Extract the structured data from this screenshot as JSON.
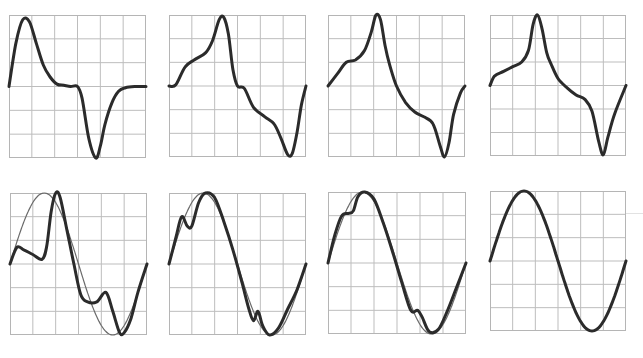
{
  "figure": {
    "layout": {
      "rows": 2,
      "cols": 4,
      "grid_divisions": 6
    },
    "colors": {
      "trace": "#2b2b2b",
      "reference": "#6a6a6a",
      "grid": "#bdbdbd"
    }
  },
  "chart_data": [
    {
      "type": "line",
      "panel": "top-1",
      "title": "",
      "xlabel": "",
      "ylabel": "",
      "grid": true,
      "xlim": [
        0,
        6
      ],
      "ylim": [
        -3,
        3
      ],
      "series": [
        {
          "name": "waveform",
          "x": [
            0,
            0.3,
            0.6,
            0.9,
            1.2,
            1.5,
            1.8,
            2.1,
            2.4,
            2.7,
            3.0,
            3.2,
            3.5,
            3.8,
            4.0,
            4.2,
            4.5,
            4.8,
            5.1,
            5.5,
            6.0
          ],
          "y": [
            0,
            1.8,
            2.8,
            2.7,
            1.8,
            0.9,
            0.4,
            0.1,
            0.05,
            0,
            0,
            -0.5,
            -2.2,
            -3.0,
            -2.5,
            -1.6,
            -0.7,
            -0.2,
            -0.05,
            0,
            0
          ]
        }
      ]
    },
    {
      "type": "line",
      "panel": "top-2",
      "title": "",
      "xlabel": "",
      "ylabel": "",
      "grid": true,
      "xlim": [
        0,
        6
      ],
      "ylim": [
        -3,
        3
      ],
      "series": [
        {
          "name": "waveform",
          "x": [
            0,
            0.3,
            0.7,
            1.1,
            1.6,
            1.9,
            2.2,
            2.4,
            2.6,
            2.8,
            3.0,
            3.3,
            3.7,
            4.2,
            4.6,
            4.9,
            5.2,
            5.4,
            5.6,
            5.8,
            6.0
          ],
          "y": [
            0,
            0.05,
            0.8,
            1.1,
            1.4,
            1.9,
            2.8,
            2.9,
            2.2,
            0.7,
            0,
            -0.1,
            -0.9,
            -1.3,
            -1.6,
            -2.2,
            -2.9,
            -2.85,
            -2.0,
            -0.8,
            0
          ]
        }
      ]
    },
    {
      "type": "line",
      "panel": "top-3",
      "title": "",
      "xlabel": "",
      "ylabel": "",
      "grid": true,
      "xlim": [
        0,
        6
      ],
      "ylim": [
        -3,
        3
      ],
      "series": [
        {
          "name": "waveform",
          "x": [
            0,
            0.4,
            0.8,
            1.2,
            1.6,
            1.9,
            2.1,
            2.3,
            2.5,
            2.7,
            3.0,
            3.4,
            3.8,
            4.2,
            4.6,
            4.9,
            5.1,
            5.3,
            5.5,
            5.8,
            6.0
          ],
          "y": [
            0,
            0.5,
            1.0,
            1.1,
            1.5,
            2.3,
            3.0,
            2.8,
            1.7,
            0.9,
            0,
            -0.7,
            -1.1,
            -1.3,
            -1.6,
            -2.5,
            -3.0,
            -2.4,
            -1.2,
            -0.3,
            0
          ]
        }
      ]
    },
    {
      "type": "line",
      "panel": "top-4",
      "title": "",
      "xlabel": "",
      "ylabel": "",
      "grid": true,
      "xlim": [
        0,
        6
      ],
      "ylim": [
        -3,
        3
      ],
      "series": [
        {
          "name": "waveform",
          "x": [
            0,
            0.2,
            0.6,
            1.0,
            1.4,
            1.7,
            1.9,
            2.1,
            2.3,
            2.5,
            2.7,
            3.0,
            3.4,
            3.8,
            4.2,
            4.5,
            4.8,
            5.0,
            5.2,
            5.5,
            6.0
          ],
          "y": [
            0,
            0.4,
            0.6,
            0.8,
            1.0,
            1.5,
            2.6,
            3.0,
            2.4,
            1.4,
            0.9,
            0.3,
            -0.1,
            -0.4,
            -0.6,
            -1.1,
            -2.4,
            -2.95,
            -2.2,
            -1.2,
            0
          ]
        }
      ]
    },
    {
      "type": "line",
      "panel": "bottom-1",
      "title": "",
      "xlabel": "",
      "ylabel": "",
      "grid": true,
      "xlim": [
        0,
        6
      ],
      "ylim": [
        -3,
        3
      ],
      "series": [
        {
          "name": "distorted",
          "x": [
            0,
            0.3,
            0.6,
            1.0,
            1.4,
            1.6,
            1.8,
            2.0,
            2.2,
            2.5,
            2.8,
            3.1,
            3.4,
            3.8,
            4.2,
            4.5,
            4.8,
            5.0,
            5.3,
            5.6,
            6.0
          ],
          "y": [
            0,
            0.7,
            0.6,
            0.4,
            0.2,
            0.7,
            2.2,
            3.0,
            2.8,
            1.4,
            0,
            -1.3,
            -1.6,
            -1.6,
            -1.2,
            -2.0,
            -2.9,
            -2.9,
            -2.3,
            -1.2,
            0
          ]
        },
        {
          "name": "reference-sine",
          "function": "3*sin(pi*x/3)",
          "x": [
            0,
            1.5,
            3,
            4.5,
            6
          ],
          "y": [
            0,
            3,
            0,
            -3,
            0
          ]
        }
      ]
    },
    {
      "type": "line",
      "panel": "bottom-2",
      "title": "",
      "xlabel": "",
      "ylabel": "",
      "grid": true,
      "xlim": [
        0,
        6
      ],
      "ylim": [
        -3,
        3
      ],
      "series": [
        {
          "name": "distorted",
          "x": [
            0,
            0.3,
            0.55,
            0.8,
            1.0,
            1.3,
            1.6,
            2.0,
            2.4,
            2.8,
            3.2,
            3.5,
            3.7,
            3.9,
            4.1,
            4.4,
            4.8,
            5.2,
            5.6,
            6.0
          ],
          "y": [
            0,
            1.1,
            2.0,
            1.6,
            1.6,
            2.6,
            3.0,
            2.8,
            1.8,
            0.6,
            -0.8,
            -1.9,
            -2.4,
            -2.0,
            -2.6,
            -3.0,
            -2.7,
            -1.9,
            -1.1,
            0
          ]
        },
        {
          "name": "reference-sine",
          "function": "3*sin(pi*x/3)",
          "x": [
            0,
            1.5,
            3,
            4.5,
            6
          ],
          "y": [
            0,
            3,
            0,
            -3,
            0
          ]
        }
      ]
    },
    {
      "type": "line",
      "panel": "bottom-3",
      "title": "",
      "xlabel": "",
      "ylabel": "",
      "grid": true,
      "xlim": [
        0,
        6
      ],
      "ylim": [
        -3,
        3
      ],
      "series": [
        {
          "name": "distorted",
          "x": [
            0,
            0.3,
            0.6,
            0.9,
            1.1,
            1.3,
            1.6,
            2.0,
            2.4,
            2.8,
            3.2,
            3.6,
            3.9,
            4.1,
            4.4,
            4.8,
            5.2,
            5.6,
            6.0
          ],
          "y": [
            0,
            1.2,
            2.0,
            2.1,
            2.2,
            2.8,
            3.0,
            2.7,
            1.7,
            0.5,
            -0.8,
            -2.0,
            -2.0,
            -2.3,
            -2.9,
            -2.8,
            -2.0,
            -1.0,
            0
          ]
        },
        {
          "name": "reference-sine",
          "function": "3*sin(pi*x/3)",
          "x": [
            0,
            1.5,
            3,
            4.5,
            6
          ],
          "y": [
            0,
            3,
            0,
            -3,
            0
          ]
        }
      ]
    },
    {
      "type": "line",
      "panel": "bottom-4",
      "title": "",
      "xlabel": "",
      "ylabel": "",
      "grid": true,
      "xlim": [
        0,
        6
      ],
      "ylim": [
        -3,
        3
      ],
      "series": [
        {
          "name": "sine",
          "function": "3*sin(pi*x/3)",
          "x": [
            0,
            0.75,
            1.5,
            2.25,
            3,
            3.75,
            4.5,
            5.25,
            6
          ],
          "y": [
            0,
            2.12,
            3,
            2.12,
            0,
            -2.12,
            -3,
            -2.12,
            0
          ]
        }
      ]
    }
  ]
}
